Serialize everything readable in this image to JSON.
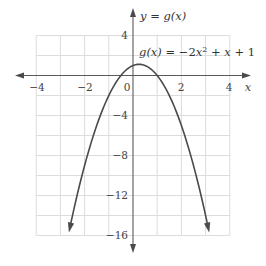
{
  "chart_data": {
    "type": "line",
    "title": "",
    "function": "g(x) = -2x^2 + x + 1",
    "coefficients": {
      "a": -2,
      "b": 1,
      "c": 1
    },
    "vertex": {
      "x": 0.25,
      "y": 1.125
    },
    "x_intercepts": [
      -0.5,
      1
    ],
    "y_intercept": 1,
    "curve_domain": [
      -2.65,
      3.15
    ],
    "xlabel": "x",
    "ylabel": "y = g(x)",
    "xlim": [
      -4,
      4
    ],
    "ylim": [
      -16,
      4
    ],
    "x_ticks": [
      -4,
      -2,
      0,
      2,
      4
    ],
    "x_tick_labels": [
      "−4",
      "−2",
      "0",
      "2",
      "4"
    ],
    "y_ticks": [
      4,
      -4,
      -8,
      -12,
      -16
    ],
    "y_tick_labels": [
      "4",
      "−4",
      "−8",
      "−12",
      "−16"
    ],
    "grid": true,
    "grid_x_step": 1,
    "grid_y_step": 2,
    "legend": null,
    "annotations": [
      {
        "text": "g(x) = −2x² + x + 1",
        "x": 0.2,
        "y": 2.5
      }
    ],
    "colors": {
      "curve": "#4a4a4a",
      "axis": "#5a5a5a",
      "grid": "#dcdcdc"
    }
  },
  "labels": {
    "y_axis": {
      "lhs": "y",
      "eq": " = ",
      "fn": "g",
      "arg": "(x)"
    },
    "x_axis": "x",
    "equation": {
      "g": "g",
      "arg": "(x)",
      "eq": " = −2",
      "x": "x",
      "sup": "2",
      "rest1": " + ",
      "x2": "x",
      "rest2": " + 1"
    },
    "origin": "0",
    "x_tick_m4": "−4",
    "x_tick_m2": "−2",
    "x_tick_2": "2",
    "x_tick_4": "4",
    "y_tick_4": "4",
    "y_tick_m4": "−4",
    "y_tick_m8": "−8",
    "y_tick_m12": "−12",
    "y_tick_m16": "−16"
  }
}
